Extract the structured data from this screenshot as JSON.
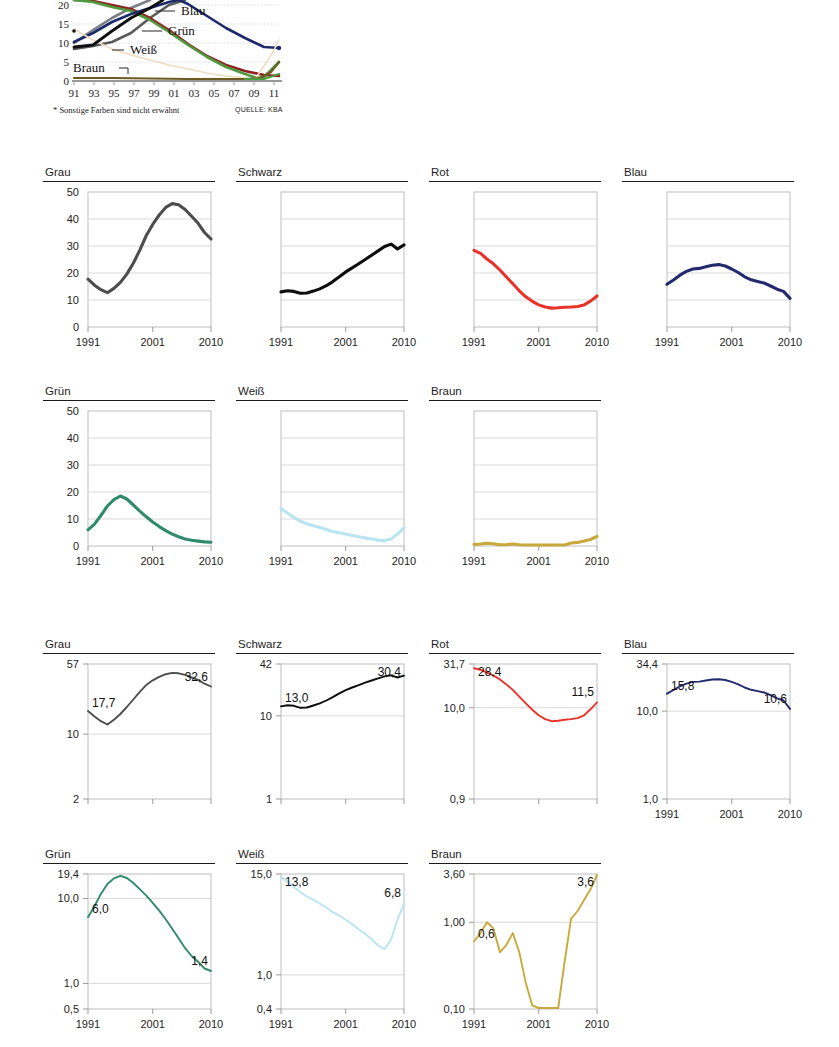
{
  "top_figure": {
    "y_ticks": [
      "20",
      "15",
      "10",
      "5",
      "0"
    ],
    "x_ticks": [
      "91",
      "93",
      "95",
      "97",
      "99",
      "01",
      "03",
      "05",
      "07",
      "09",
      "11"
    ],
    "legend": [
      {
        "label": "Blau",
        "color": "#1c2a6b"
      },
      {
        "label": "Grün",
        "color": "#4e9b3f"
      },
      {
        "label": "Weiß",
        "color": "#f0dcc0"
      },
      {
        "label": "Braun",
        "color": "#6d5a22"
      }
    ],
    "footnote": "* Sonstige Farben sind nicht erwähnt",
    "source": "QUELLE: KBA"
  },
  "colors": {
    "grau": "#4d4d4d",
    "schwarz": "#0d0d0d",
    "rot": "#e8332a",
    "blau": "#242a6e",
    "gruen": "#2f8b6c",
    "weiss": "#b9e5f2",
    "braun": "#c9a93b"
  },
  "section_linear": {
    "x_ticks": [
      "1991",
      "2001",
      "2010"
    ],
    "y_ticks": [
      "50",
      "40",
      "30",
      "20",
      "10",
      "0"
    ],
    "panels": [
      {
        "title": "Grau",
        "color_key": "grau"
      },
      {
        "title": "Schwarz",
        "color_key": "schwarz"
      },
      {
        "title": "Rot",
        "color_key": "rot"
      },
      {
        "title": "Blau",
        "color_key": "blau"
      },
      {
        "title": "Grün",
        "color_key": "gruen"
      },
      {
        "title": "Weiß",
        "color_key": "weiss"
      },
      {
        "title": "Braun",
        "color_key": "braun"
      }
    ]
  },
  "section_log": {
    "x_ticks": [
      "1991",
      "2001",
      "2010"
    ],
    "panels": [
      {
        "title": "Grau",
        "color_key": "grau",
        "y_ticks": [
          "57",
          "10",
          "2"
        ],
        "start_label": "17,7",
        "end_label": "32,6"
      },
      {
        "title": "Schwarz",
        "color_key": "schwarz",
        "y_ticks": [
          "42",
          "10",
          "1"
        ],
        "start_label": "13,0",
        "end_label": "30,4"
      },
      {
        "title": "Rot",
        "color_key": "rot",
        "y_ticks": [
          "31,7",
          "10,0",
          "0,9"
        ],
        "start_label": "28,4",
        "end_label": "11,5"
      },
      {
        "title": "Blau",
        "color_key": "blau",
        "y_ticks": [
          "34,4",
          "10,0",
          "1,0"
        ],
        "start_label": "15,8",
        "end_label": "10,6"
      },
      {
        "title": "Grün",
        "color_key": "gruen",
        "y_ticks": [
          "19,4",
          "10,0",
          "1,0",
          "0,5"
        ],
        "start_label": "6,0",
        "end_label": "1,4"
      },
      {
        "title": "Weiß",
        "color_key": "weiss",
        "y_ticks": [
          "15,0",
          "1,0",
          "0,4"
        ],
        "start_label": "13,8",
        "end_label": "6,8"
      },
      {
        "title": "Braun",
        "color_key": "braun",
        "y_ticks": [
          "3,60",
          "1,00",
          "0,10"
        ],
        "start_label": "0,6",
        "end_label": "3,6"
      }
    ]
  },
  "chart_data": {
    "type": "line",
    "xlabel": "",
    "ylabel": "Anteil in Prozent",
    "x": [
      1991,
      1992,
      1993,
      1994,
      1995,
      1996,
      1997,
      1998,
      1999,
      2000,
      2001,
      2002,
      2003,
      2004,
      2005,
      2006,
      2007,
      2008,
      2009,
      2010
    ],
    "ylim_linear": [
      0,
      50
    ],
    "grid": true,
    "legend_position": "inside",
    "series": [
      {
        "name": "Grau",
        "color": "#4d4d4d",
        "values": [
          17.7,
          15.5,
          13.8,
          12.7,
          14.3,
          16.5,
          19.6,
          23.6,
          28.5,
          33.9,
          38.0,
          41.5,
          44.3,
          45.7,
          45.3,
          43.5,
          41.0,
          38.4,
          35.0,
          32.6
        ]
      },
      {
        "name": "Schwarz",
        "color": "#0d0d0d",
        "values": [
          13.0,
          13.4,
          13.2,
          12.5,
          12.6,
          13.3,
          14.1,
          15.3,
          16.8,
          18.6,
          20.4,
          21.9,
          23.4,
          25.0,
          26.6,
          28.2,
          29.8,
          30.7,
          28.9,
          30.4
        ]
      },
      {
        "name": "Rot",
        "color": "#e8332a",
        "values": [
          28.4,
          27.3,
          25.2,
          23.4,
          21.1,
          18.5,
          16.0,
          13.4,
          11.2,
          9.5,
          8.2,
          7.4,
          7.0,
          7.1,
          7.3,
          7.4,
          7.6,
          8.2,
          9.6,
          11.5
        ]
      },
      {
        "name": "Blau",
        "color": "#242a6e",
        "values": [
          15.8,
          17.4,
          19.2,
          20.6,
          21.5,
          21.7,
          22.3,
          22.9,
          23.1,
          22.6,
          21.5,
          20.2,
          18.6,
          17.5,
          16.9,
          16.3,
          15.2,
          14.0,
          13.2,
          10.6
        ]
      },
      {
        "name": "Grün",
        "color": "#2f8b6c",
        "values": [
          6.0,
          8.1,
          11.3,
          14.8,
          17.2,
          18.5,
          17.4,
          15.2,
          12.9,
          10.8,
          8.9,
          7.2,
          5.7,
          4.4,
          3.4,
          2.6,
          2.1,
          1.8,
          1.5,
          1.4
        ]
      },
      {
        "name": "Weiß",
        "color": "#b9e5f2",
        "values": [
          13.8,
          12.2,
          10.6,
          9.2,
          8.2,
          7.5,
          6.8,
          6.1,
          5.4,
          4.9,
          4.4,
          3.9,
          3.4,
          3.0,
          2.6,
          2.2,
          2.0,
          2.6,
          4.4,
          6.8
        ]
      },
      {
        "name": "Braun",
        "color": "#c9a93b",
        "values": [
          0.6,
          0.75,
          1.0,
          0.85,
          0.45,
          0.55,
          0.75,
          0.45,
          0.2,
          0.11,
          0.1,
          0.1,
          0.1,
          0.1,
          0.35,
          1.1,
          1.35,
          1.8,
          2.4,
          3.6
        ]
      }
    ]
  }
}
